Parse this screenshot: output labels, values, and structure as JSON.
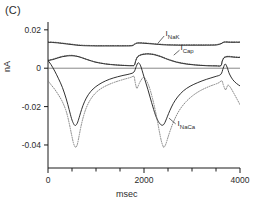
{
  "figure": {
    "panel_label": "(C)",
    "axis_label_y": "nA",
    "axis_label_x": "msec"
  },
  "axes": {
    "y_ticks": [
      {
        "value": 0.02,
        "label": "0.02"
      },
      {
        "value": 0.0,
        "label": "0"
      },
      {
        "value": -0.02,
        "label": "-0.02"
      },
      {
        "value": -0.04,
        "label": "-0.04"
      }
    ],
    "x_ticks": [
      {
        "value": 0,
        "label": "0"
      },
      {
        "value": 2000,
        "label": "2000"
      },
      {
        "value": 4000,
        "label": "4000"
      }
    ],
    "x_minor_step": 500,
    "xlim": [
      0,
      4000
    ],
    "ylim": [
      -0.052,
      0.022
    ]
  },
  "series_labels": {
    "nak": {
      "base": "I",
      "sub": "NaK"
    },
    "cap": {
      "base": "I",
      "sub": "Cap"
    },
    "naca": {
      "base": "I",
      "sub": "NaCa"
    }
  },
  "chart_data": {
    "type": "line",
    "title": "(C)",
    "xlabel": "msec",
    "ylabel": "nA",
    "xlim": [
      0,
      4000
    ],
    "ylim": [
      -0.052,
      0.022
    ],
    "grid": false,
    "legend": "inline-annotations",
    "x_ticks": [
      0,
      2000,
      4000
    ],
    "y_ticks": [
      0.02,
      0,
      -0.02,
      -0.04
    ],
    "series": [
      {
        "name": "I_NaK (solid)",
        "style": "solid",
        "color": "#1a1a1a",
        "x": [
          0,
          100,
          200,
          300,
          400,
          500,
          600,
          700,
          800,
          1000,
          1200,
          1400,
          1600,
          1750,
          1800,
          1850,
          1900,
          2000,
          2100,
          2200,
          2300,
          2400,
          2500,
          2700,
          2900,
          3100,
          3300,
          3500,
          3600,
          3650,
          3700,
          3800,
          3900,
          4000
        ],
        "y": [
          0.0135,
          0.0134,
          0.0132,
          0.0129,
          0.0126,
          0.0123,
          0.012,
          0.0118,
          0.0117,
          0.0116,
          0.0116,
          0.0116,
          0.0116,
          0.0117,
          0.0124,
          0.013,
          0.0131,
          0.013,
          0.0128,
          0.0126,
          0.0124,
          0.0122,
          0.0121,
          0.012,
          0.012,
          0.012,
          0.012,
          0.0121,
          0.0127,
          0.0134,
          0.0136,
          0.0135,
          0.0135,
          0.0135
        ]
      },
      {
        "name": "I_NaK (dotted)",
        "style": "dotted",
        "color": "#3a3a3a",
        "x": [
          0,
          100,
          200,
          300,
          400,
          500,
          600,
          700,
          800,
          1000,
          1200,
          1400,
          1600,
          1750,
          1800,
          1850,
          1900,
          2000,
          2100,
          2200,
          2300,
          2400,
          2500,
          2700,
          2900,
          3100,
          3300,
          3500,
          3600,
          3650,
          3700,
          3800,
          3900,
          4000
        ],
        "y": [
          0.0137,
          0.0136,
          0.0134,
          0.0131,
          0.0128,
          0.0125,
          0.0122,
          0.012,
          0.0119,
          0.0118,
          0.0118,
          0.0118,
          0.0118,
          0.0119,
          0.0126,
          0.0132,
          0.0133,
          0.0132,
          0.013,
          0.0128,
          0.0126,
          0.0124,
          0.0123,
          0.0122,
          0.0122,
          0.0122,
          0.0122,
          0.0123,
          0.0129,
          0.0136,
          0.0138,
          0.0137,
          0.0137,
          0.0137
        ]
      },
      {
        "name": "I_Cap (solid)",
        "style": "solid",
        "color": "#1a1a1a",
        "x": [
          0,
          100,
          200,
          300,
          400,
          500,
          600,
          700,
          800,
          900,
          1000,
          1200,
          1400,
          1600,
          1750,
          1800,
          1830,
          1870,
          1950,
          2050,
          2150,
          2250,
          2350,
          2450,
          2550,
          2700,
          2900,
          3100,
          3300,
          3500,
          3600,
          3630,
          3670,
          3750,
          3850,
          3950,
          4000
        ],
        "y": [
          0.004,
          0.0045,
          0.0053,
          0.006,
          0.0064,
          0.0065,
          0.0062,
          0.0055,
          0.0046,
          0.0038,
          0.0031,
          0.0022,
          0.0017,
          0.0014,
          0.0013,
          0.0016,
          0.004,
          0.006,
          0.007,
          0.0074,
          0.0073,
          0.0068,
          0.006,
          0.005,
          0.0041,
          0.003,
          0.0021,
          0.0016,
          0.0013,
          0.0012,
          0.0013,
          0.0036,
          0.0055,
          0.006,
          0.0058,
          0.0056,
          0.0056
        ]
      },
      {
        "name": "I_Cap (dotted)",
        "style": "dotted",
        "color": "#3a3a3a",
        "x": [
          0,
          100,
          200,
          300,
          400,
          500,
          600,
          700,
          800,
          900,
          1000,
          1200,
          1400,
          1600,
          1750,
          1800,
          1830,
          1870,
          1950,
          2050,
          2150,
          2250,
          2350,
          2450,
          2550,
          2700,
          2900,
          3100,
          3300,
          3500,
          3600,
          3630,
          3670,
          3750,
          3850,
          3950,
          4000
        ],
        "y": [
          0.0042,
          0.0047,
          0.0055,
          0.0062,
          0.0066,
          0.0067,
          0.0063,
          0.0056,
          0.0047,
          0.0039,
          0.0032,
          0.0023,
          0.0018,
          0.0015,
          0.0014,
          0.0017,
          0.0042,
          0.0062,
          0.0072,
          0.0076,
          0.0075,
          0.007,
          0.0062,
          0.0052,
          0.0043,
          0.0032,
          0.0023,
          0.0017,
          0.0014,
          0.0013,
          0.0014,
          0.0038,
          0.0057,
          0.0062,
          0.006,
          0.0058,
          0.0058
        ]
      },
      {
        "name": "I_NaCa (solid)",
        "style": "solid",
        "color": "#1a1a1a",
        "x": [
          0,
          60,
          140,
          220,
          300,
          380,
          440,
          490,
          530,
          560,
          590,
          620,
          660,
          700,
          760,
          840,
          940,
          1060,
          1200,
          1360,
          1540,
          1700,
          1790,
          1840,
          1880,
          1930,
          2000,
          2080,
          2160,
          2240,
          2300,
          2350,
          2390,
          2420,
          2450,
          2490,
          2540,
          2610,
          2700,
          2820,
          2960,
          3120,
          3300,
          3480,
          3600,
          3650,
          3690,
          3730,
          3780,
          3850,
          3930,
          4000
        ],
        "y": [
          0.004,
          0.002,
          -0.0015,
          -0.0055,
          -0.01,
          -0.016,
          -0.0215,
          -0.0262,
          -0.0288,
          -0.0298,
          -0.0295,
          -0.028,
          -0.0248,
          -0.0215,
          -0.0175,
          -0.0138,
          -0.0108,
          -0.0085,
          -0.0066,
          -0.0051,
          -0.0039,
          -0.003,
          -0.002,
          0.001,
          0.0028,
          0.0012,
          -0.0045,
          -0.011,
          -0.018,
          -0.0245,
          -0.0278,
          -0.0294,
          -0.0297,
          -0.029,
          -0.0275,
          -0.025,
          -0.022,
          -0.0184,
          -0.015,
          -0.0118,
          -0.0094,
          -0.0075,
          -0.0058,
          -0.0044,
          -0.0032,
          0.0,
          0.0022,
          0.0006,
          -0.003,
          -0.006,
          -0.008,
          -0.0092
        ]
      },
      {
        "name": "I_NaCa (dotted)",
        "style": "dotted",
        "color": "#6a6a6a",
        "x": [
          0,
          60,
          140,
          220,
          300,
          380,
          440,
          490,
          530,
          560,
          580,
          600,
          620,
          650,
          690,
          740,
          800,
          880,
          980,
          1100,
          1240,
          1400,
          1580,
          1720,
          1790,
          1810,
          1830,
          1850,
          1870,
          1900,
          1940,
          2000,
          2090,
          2180,
          2260,
          2320,
          2360,
          2390,
          2410,
          2430,
          2460,
          2500,
          2560,
          2640,
          2740,
          2870,
          3020,
          3180,
          3360,
          3540,
          3620,
          3650,
          3680,
          3700,
          3720,
          3750,
          3800,
          3870,
          3940,
          4000
        ],
        "y": [
          -0.0065,
          -0.0085,
          -0.011,
          -0.014,
          -0.0175,
          -0.0225,
          -0.0285,
          -0.0345,
          -0.039,
          -0.0408,
          -0.0412,
          -0.0405,
          -0.0388,
          -0.035,
          -0.03,
          -0.025,
          -0.0205,
          -0.0165,
          -0.0132,
          -0.0107,
          -0.0088,
          -0.0072,
          -0.0058,
          -0.0048,
          -0.0042,
          -0.0065,
          -0.009,
          -0.0105,
          -0.0098,
          -0.008,
          -0.0062,
          -0.0048,
          -0.0085,
          -0.016,
          -0.025,
          -0.033,
          -0.0378,
          -0.0402,
          -0.0412,
          -0.0408,
          -0.0392,
          -0.036,
          -0.0315,
          -0.0265,
          -0.0218,
          -0.0176,
          -0.0142,
          -0.0116,
          -0.0095,
          -0.0078,
          -0.0066,
          -0.0085,
          -0.0105,
          -0.0112,
          -0.0104,
          -0.0088,
          -0.01,
          -0.013,
          -0.0162,
          -0.019
        ]
      }
    ],
    "annotations": [
      {
        "text": "I_NaK",
        "x": 2450,
        "y": 0.0175
      },
      {
        "text": "I_Cap",
        "x": 2760,
        "y": 0.0098
      },
      {
        "text": "I_NaCa",
        "x": 2700,
        "y": -0.0295
      }
    ]
  }
}
